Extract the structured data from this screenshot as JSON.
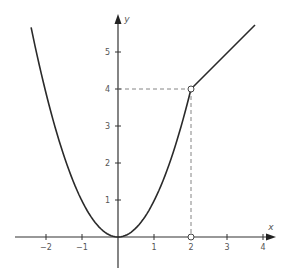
{
  "chart_data": {
    "type": "line",
    "title": "",
    "xlabel": "x",
    "ylabel": "y",
    "xlim": [
      -2.8,
      4.3
    ],
    "ylim": [
      -0.85,
      6.0
    ],
    "grid": false,
    "legend": null,
    "x_ticks": [
      -2,
      -1,
      1,
      2,
      3,
      4
    ],
    "y_ticks": [
      1,
      2,
      3,
      4,
      5
    ],
    "series": [
      {
        "name": "f(x) = x^2 for x <= 2",
        "expression": "x^2",
        "domain": [
          -2.38,
          2
        ],
        "points": [
          [
            -2.38,
            5.66
          ],
          [
            -2,
            4
          ],
          [
            -1,
            1
          ],
          [
            0,
            0
          ],
          [
            1,
            1
          ],
          [
            2,
            4
          ]
        ]
      },
      {
        "name": "f(x) = x + 2 for x >= 2",
        "expression": "x + 2",
        "domain": [
          2,
          3.75
        ],
        "points": [
          [
            2,
            4
          ],
          [
            3,
            5
          ],
          [
            3.75,
            5.75
          ]
        ]
      }
    ],
    "annotations": [
      {
        "type": "open-circle",
        "x": 2,
        "y": 4
      },
      {
        "type": "open-circle",
        "x": 2,
        "y": 0
      },
      {
        "type": "dashed-line",
        "from": [
          0,
          4
        ],
        "to": [
          2,
          4
        ]
      },
      {
        "type": "dashed-line",
        "from": [
          2,
          4
        ],
        "to": [
          2,
          0
        ]
      }
    ]
  },
  "labels": {
    "x_axis": "x",
    "y_axis": "y",
    "x_ticks": [
      "−2",
      "−1",
      "1",
      "2",
      "3",
      "4"
    ],
    "y_ticks": [
      "1",
      "2",
      "3",
      "4",
      "5"
    ]
  },
  "colors": {
    "axis": "#333333",
    "curve": "#2a2a2a",
    "dashed": "#777777",
    "text": "#555555"
  }
}
